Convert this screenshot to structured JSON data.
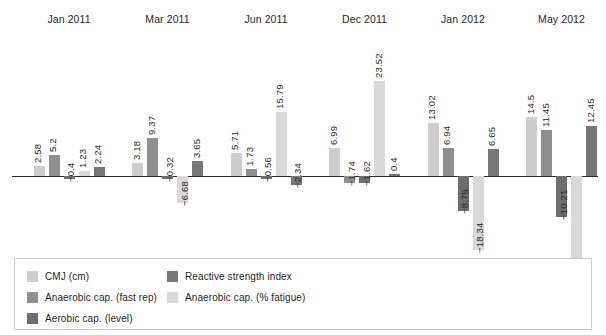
{
  "chart_data": {
    "type": "bar",
    "title": "",
    "subtitle": "",
    "xlabel": "",
    "ylabel": "",
    "grid": false,
    "legend_position": "bottom-left",
    "orientation": "vertical",
    "baseline": 0,
    "ylim": [
      -30,
      26
    ],
    "categories": [
      "Jan 2011",
      "Mar 2011",
      "Jun 2011",
      "Dec 2011",
      "Jan 2012",
      "May 2012"
    ],
    "series": [
      {
        "name": "CMJ (cm)",
        "color": "#cdcdcd",
        "values": [
          2.58,
          3.18,
          5.71,
          6.99,
          13.02,
          14.5
        ]
      },
      {
        "name": "Anaerobic cap. (fast rep)",
        "color": "#8f8f8f",
        "values": [
          5.2,
          9.37,
          1.73,
          -1.74,
          6.94,
          11.45
        ]
      },
      {
        "name": "Aerobic cap. (level)",
        "color": "#6e6e6e",
        "values": [
          -0.4,
          -0.32,
          -0.56,
          -1.62,
          -8.75,
          -10.21
        ]
      },
      {
        "name": "Anaerobic cap. (% fatigue)",
        "color": "#d9d9d9",
        "values": [
          1.23,
          -6.68,
          15.79,
          23.52,
          -18.34,
          -27.78
        ]
      },
      {
        "name": "Reactive strength index",
        "color": "#777777",
        "values": [
          2.24,
          3.65,
          -2.34,
          0.4,
          6.65,
          12.45
        ]
      }
    ],
    "data_labels": [
      [
        "2.58",
        "5.2",
        "−0.4",
        "1.23",
        "2.24"
      ],
      [
        "3.18",
        "9.37",
        "−0.32",
        "−6.68",
        "3.65"
      ],
      [
        "5.71",
        "1.73",
        "−0.56",
        "15.79",
        "−2.34"
      ],
      [
        "6.99",
        "−1.74",
        "−1.62",
        "23.52",
        "0.4"
      ],
      [
        "13.02",
        "6.94",
        "−8.75",
        "−18.34",
        "6.65"
      ],
      [
        "14.5",
        "11.45",
        "−10.21",
        "−27.78",
        "12.45"
      ]
    ]
  },
  "legend": {
    "column_1": [
      {
        "label": "CMJ (cm)",
        "color": "#cdcdcd",
        "swatch_name": "legend-swatch-cmj"
      },
      {
        "label": "Anaerobic cap. (fast rep)",
        "color": "#8f8f8f",
        "swatch_name": "legend-swatch-anaerobic-fast-rep"
      },
      {
        "label": "Aerobic cap. (level)",
        "color": "#6e6e6e",
        "swatch_name": "legend-swatch-aerobic-level"
      }
    ],
    "column_2": [
      {
        "label": "Reactive strength index",
        "color": "#777777",
        "swatch_name": "legend-swatch-reactive-strength-index"
      },
      {
        "label": "Anaerobic cap. (% fatigue)",
        "color": "#d9d9d9",
        "swatch_name": "legend-swatch-anaerobic-fatigue"
      }
    ]
  },
  "style": {
    "axis_color": "#2b2b2b",
    "background": "#ffffff",
    "label_color": "#2a2a2a"
  }
}
